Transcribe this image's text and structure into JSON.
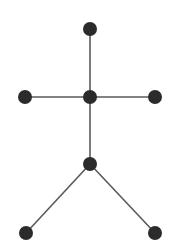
{
  "diagram": {
    "type": "tree-graph",
    "colors": {
      "background": "#ffffff",
      "node": "#2b2b2b",
      "edge": "#5a5a5a"
    },
    "node_radius": 7,
    "nodes": [
      {
        "id": "top",
        "x": 90,
        "y": 29
      },
      {
        "id": "left",
        "x": 25,
        "y": 97
      },
      {
        "id": "center",
        "x": 90,
        "y": 97
      },
      {
        "id": "right",
        "x": 155,
        "y": 97
      },
      {
        "id": "hip",
        "x": 90,
        "y": 164
      },
      {
        "id": "bottom-left",
        "x": 26,
        "y": 233
      },
      {
        "id": "bottom-right",
        "x": 155,
        "y": 233
      }
    ],
    "edges": [
      {
        "from": "top",
        "to": "center"
      },
      {
        "from": "left",
        "to": "center"
      },
      {
        "from": "center",
        "to": "right"
      },
      {
        "from": "center",
        "to": "hip"
      },
      {
        "from": "hip",
        "to": "bottom-left"
      },
      {
        "from": "hip",
        "to": "bottom-right"
      }
    ]
  }
}
